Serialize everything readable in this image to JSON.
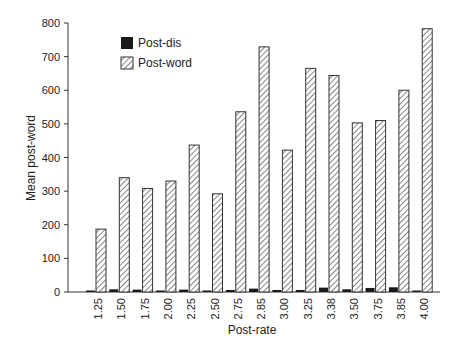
{
  "chart_data": {
    "type": "bar",
    "title": "",
    "xlabel": "Post-rate",
    "ylabel": "Mean post-word",
    "ylim": [
      0,
      800
    ],
    "yticks": [
      0,
      100,
      200,
      300,
      400,
      500,
      600,
      700,
      800
    ],
    "grid": false,
    "legend_position": "upper-left-inside",
    "categories": [
      "1.25",
      "1.50",
      "1.75",
      "2.00",
      "2.25",
      "2.50",
      "2.75",
      "2.85",
      "3.00",
      "3.25",
      "3.38",
      "3.50",
      "3.75",
      "3.85",
      "4.00"
    ],
    "series": [
      {
        "name": "Post-dis",
        "style": "solid-black",
        "color": "#1a1a1a",
        "values": [
          3,
          8,
          7,
          4,
          7,
          3,
          6,
          10,
          6,
          6,
          13,
          8,
          12,
          14,
          3
        ]
      },
      {
        "name": "Post-word",
        "style": "diagonal-hatch",
        "color": "#555555",
        "values": [
          187,
          340,
          308,
          330,
          437,
          292,
          536,
          729,
          422,
          665,
          644,
          503,
          510,
          600,
          783
        ]
      }
    ]
  },
  "legend": {
    "items": [
      {
        "label": "Post-dis"
      },
      {
        "label": "Post-word"
      }
    ]
  }
}
